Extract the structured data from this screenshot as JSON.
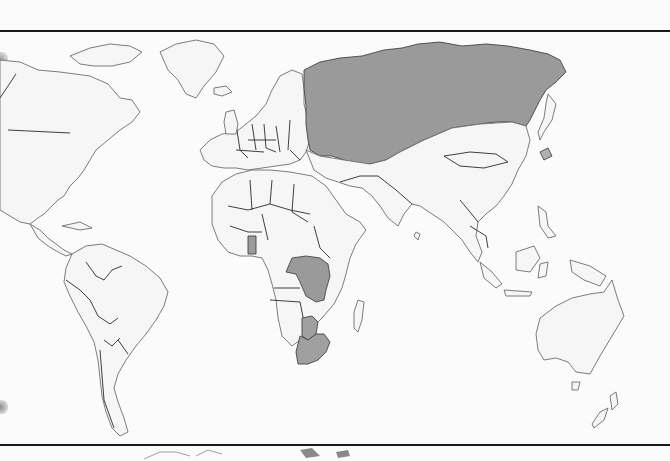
{
  "map": {
    "type": "world-political-outline",
    "style": "grayscale scan",
    "background": "#fbfbfb",
    "land_fill": "#f6f6f6",
    "highlight_fill": "#9a9a9a",
    "highlighted_countries": [
      {
        "name": "Russia",
        "id": "russia"
      },
      {
        "name": "Democratic Republic of the Congo",
        "id": "dr-congo"
      },
      {
        "name": "Ghana",
        "id": "ghana"
      },
      {
        "name": "Botswana",
        "id": "botswana"
      },
      {
        "name": "South Africa",
        "id": "south-africa"
      }
    ],
    "continents": [
      "North America",
      "South America",
      "Europe",
      "Africa",
      "Asia",
      "Australia"
    ]
  }
}
